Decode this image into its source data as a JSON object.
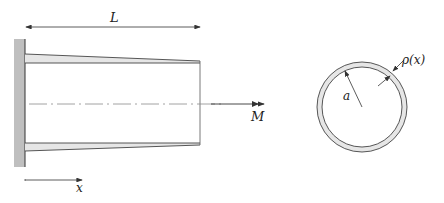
{
  "diagram": {
    "beam": {
      "length_label": "L",
      "moment_label": "M",
      "axis_label": "x"
    },
    "cross_section": {
      "radius_label": "a",
      "thickness_label": "ρ(x)"
    },
    "colors": {
      "stroke": "#444444",
      "wall_fill": "#bfbfbf",
      "wall_fill_taper": "#e6e6e6",
      "centerline": "#8a8a8a"
    }
  }
}
